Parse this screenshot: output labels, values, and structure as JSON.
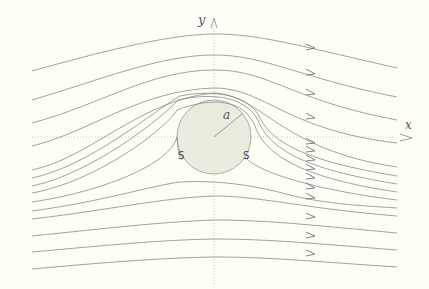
{
  "diagram": {
    "axes": {
      "x_label": "x",
      "y_label": "y"
    },
    "cylinder": {
      "radius_label": "a",
      "fill": "#ecebe0",
      "stroke": "#999999"
    },
    "separation_points": [
      {
        "label": "S",
        "side": "left"
      },
      {
        "label": "S",
        "side": "right"
      }
    ],
    "streamline_color": "#8a8a8a",
    "axis_color": "#bbbbbb",
    "streamline_count": 14
  }
}
